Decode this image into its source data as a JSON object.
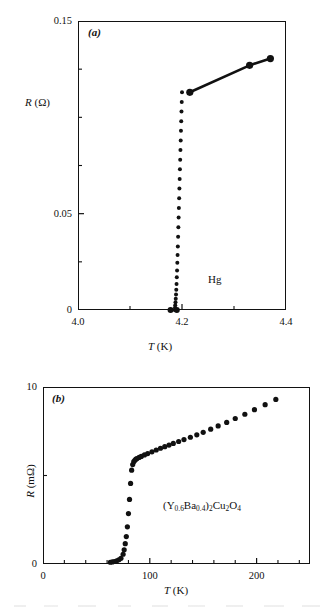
{
  "figure": {
    "title": "",
    "panels": [
      "a",
      "b"
    ]
  },
  "chart_data": [
    {
      "type": "scatter",
      "panel_label": "(a)",
      "title": "",
      "subtitle": "",
      "xlabel": "T (K)",
      "ylabel": "R (Ω)",
      "annotation": "Hg",
      "xlim": [
        4.0,
        4.4
      ],
      "ylim": [
        0.0,
        0.15
      ],
      "xticks_major": [
        4.0,
        4.2,
        4.4
      ],
      "xticklabels": [
        "4.0",
        "4.2",
        "4.4"
      ],
      "xticks_minor": [
        4.1,
        4.3
      ],
      "yticks_major": [
        0.0,
        0.05,
        0.15
      ],
      "yticklabels": [
        "0",
        "0.05",
        "0.15"
      ],
      "yticks_minor": [
        0.025,
        0.075,
        0.1,
        0.125
      ],
      "grid": false,
      "legend": "none",
      "series": [
        {
          "name": "Hg resistive transition (dotted)",
          "style": "dotted-markers",
          "x": [
            4.2,
            4.1995,
            4.199,
            4.1985,
            4.198,
            4.1975,
            4.197,
            4.1965,
            4.196,
            4.1955,
            4.195,
            4.1945,
            4.194,
            4.1935,
            4.193,
            4.1925,
            4.192,
            4.1915,
            4.191,
            4.1905,
            4.19,
            4.1895,
            4.189,
            4.1885,
            4.188,
            4.1875,
            4.187,
            4.1865,
            4.186
          ],
          "y": [
            0.113,
            0.108,
            0.103,
            0.098,
            0.093,
            0.088,
            0.083,
            0.078,
            0.073,
            0.068,
            0.063,
            0.058,
            0.053,
            0.048,
            0.043,
            0.038,
            0.033,
            0.0285,
            0.0245,
            0.0205,
            0.017,
            0.0135,
            0.0105,
            0.008,
            0.0058,
            0.004,
            0.0025,
            0.0012,
            0.0
          ]
        },
        {
          "name": "Normal-state branch (solid line with markers)",
          "style": "line-markers",
          "x": [
            4.215,
            4.33,
            4.37
          ],
          "y": [
            0.113,
            0.127,
            0.1305
          ]
        },
        {
          "name": "Zero-resistance points",
          "style": "markers",
          "x": [
            4.178,
            4.19
          ],
          "y": [
            0.0,
            0.0
          ]
        }
      ]
    },
    {
      "type": "scatter",
      "panel_label": "(b)",
      "title": "",
      "subtitle": "",
      "xlabel": "T (K)",
      "ylabel": "R (mΩ)",
      "annotation": "(Y0.6Ba0.4)2Cu2O4",
      "annotation_parts": [
        {
          "t": "(Y",
          "sub": false
        },
        {
          "t": "0.6",
          "sub": true
        },
        {
          "t": "Ba",
          "sub": false
        },
        {
          "t": "0.4",
          "sub": true
        },
        {
          "t": ")",
          "sub": false
        },
        {
          "t": "2",
          "sub": true
        },
        {
          "t": "Cu",
          "sub": false
        },
        {
          "t": "2",
          "sub": true
        },
        {
          "t": "O",
          "sub": false
        },
        {
          "t": "4",
          "sub": true
        }
      ],
      "xlim": [
        0,
        250
      ],
      "ylim": [
        0,
        10
      ],
      "xticks_major": [
        0,
        100,
        200
      ],
      "xticklabels": [
        "0",
        "100",
        "200"
      ],
      "xticks_minor": [
        20,
        40,
        60,
        80,
        120,
        140,
        160,
        180,
        220,
        240
      ],
      "yticks_major": [
        0,
        10
      ],
      "yticklabels": [
        "0",
        "10"
      ],
      "yticks_minor": [
        5
      ],
      "grid": false,
      "legend": "none",
      "series": [
        {
          "name": "(Y0.6Ba0.4)2Cu2O4 resistance vs temperature",
          "style": "markers",
          "x": [
            63,
            65,
            67,
            69,
            71,
            73,
            75,
            76,
            77,
            78,
            79,
            80,
            81,
            82,
            83,
            84,
            85,
            86,
            87,
            88,
            90,
            92,
            95,
            98,
            102,
            106,
            110,
            114,
            118,
            122,
            127,
            132,
            138,
            144,
            150,
            157,
            164,
            172,
            180,
            189,
            198,
            208,
            218
          ],
          "y": [
            0.1,
            0.12,
            0.14,
            0.18,
            0.24,
            0.32,
            0.55,
            0.8,
            1.15,
            1.55,
            2.1,
            2.85,
            3.65,
            4.55,
            5.3,
            5.62,
            5.78,
            5.86,
            5.92,
            5.96,
            6.02,
            6.08,
            6.16,
            6.24,
            6.34,
            6.44,
            6.54,
            6.63,
            6.72,
            6.81,
            6.92,
            7.03,
            7.16,
            7.3,
            7.44,
            7.62,
            7.8,
            8.0,
            8.22,
            8.46,
            8.72,
            9.0,
            9.3
          ]
        }
      ]
    }
  ]
}
